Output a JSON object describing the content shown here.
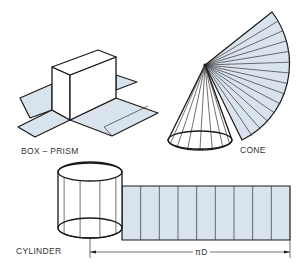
{
  "figure": {
    "colors": {
      "line": "#1a1a1a",
      "shading": "#d9e3ee",
      "background": "#ffffff",
      "label": "#333333"
    },
    "labels": {
      "box_prism": "BOX – PRISM",
      "cone": "CONE",
      "cylinder": "CYLINDER",
      "dimension": "πD"
    },
    "cone": {
      "fan_segments": 14,
      "base_elements": 7
    },
    "cylinder": {
      "development_panels": 9,
      "body_elements": 4
    }
  }
}
